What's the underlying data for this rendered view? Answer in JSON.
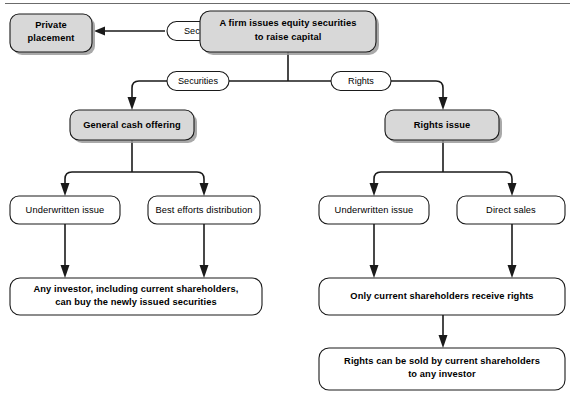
{
  "diagram": {
    "type": "flowchart",
    "colors": {
      "shaded_fill": "#d8d8d8",
      "plain_fill": "#ffffff",
      "stroke": "#1a1a1a",
      "rule": "#6b6b6b"
    },
    "nodes": {
      "private_placement": {
        "line1": "Private",
        "line2": "placement",
        "style": "shaded"
      },
      "firm_issues": {
        "line1": "A firm issues equity securities",
        "line2": "to raise capital",
        "style": "shaded"
      },
      "general_cash_offering": {
        "line1": "General cash offering",
        "style": "shaded"
      },
      "rights_issue": {
        "line1": "Rights issue",
        "style": "shaded"
      },
      "underwritten_issue_left": {
        "line1": "Underwritten issue",
        "style": "plain"
      },
      "best_efforts_distribution": {
        "line1": "Best efforts distribution",
        "style": "plain"
      },
      "underwritten_issue_right": {
        "line1": "Underwritten issue",
        "style": "plain"
      },
      "direct_sales": {
        "line1": "Direct sales",
        "style": "plain"
      },
      "any_investor": {
        "line1": "Any investor, including current shareholders,",
        "line2": "can buy the newly issued securities",
        "style": "plain"
      },
      "only_current_shareholders": {
        "line1": "Only current shareholders receive rights",
        "style": "plain"
      },
      "rights_sold": {
        "line1": "Rights can be sold by current shareholders",
        "line2": "to any investor",
        "style": "plain"
      }
    },
    "edge_labels": {
      "securities_to_private": "Securities",
      "securities_branch": "Securities",
      "rights_branch": "Rights"
    }
  }
}
